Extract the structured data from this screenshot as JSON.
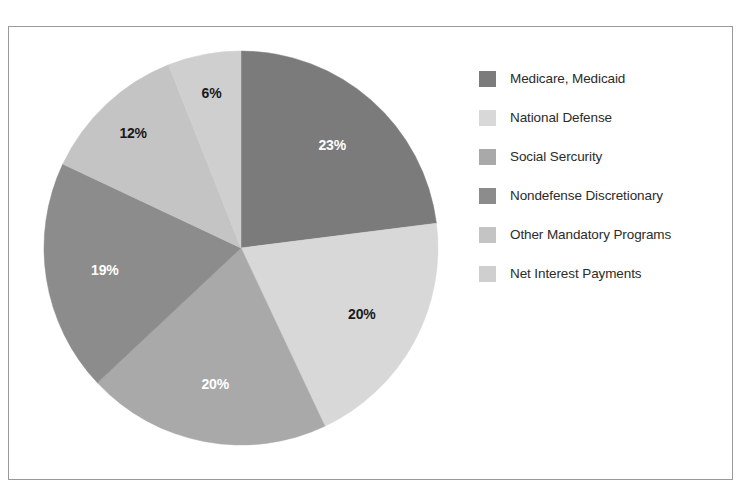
{
  "figure": {
    "clipped_caption": "",
    "frame_color": "#9a9a9a",
    "background": "#ffffff"
  },
  "chart_data": {
    "type": "pie",
    "title": "",
    "xlabel": "",
    "ylabel": "",
    "legend_position": "right",
    "grid": false,
    "start_angle_deg": 0,
    "direction": "clockwise",
    "categories": [
      "Medicare, Medicaid",
      "National Defense",
      "Social Sercurity",
      "Nondefense Discretionary",
      "Other Mandatory Programs",
      "Net Interest Payments"
    ],
    "values": [
      23,
      20,
      20,
      19,
      12,
      6
    ],
    "value_labels": [
      "23%",
      "20%",
      "20%",
      "19%",
      "12%",
      "6%"
    ],
    "colors": [
      "#7b7b7b",
      "#d8d8d8",
      "#a9a9a9",
      "#8c8c8c",
      "#c4c4c4",
      "#cfcfcf"
    ],
    "label_text_colors": [
      "#ffffff",
      "#1a1a1a",
      "#ffffff",
      "#ffffff",
      "#1a1a1a",
      "#1a1a1a"
    ]
  },
  "legend": {
    "items": [
      {
        "label": "Medicare, Medicaid",
        "color": "#7b7b7b"
      },
      {
        "label": "National Defense",
        "color": "#d8d8d8"
      },
      {
        "label": "Social Sercurity",
        "color": "#a9a9a9"
      },
      {
        "label": "Nondefense Discretionary",
        "color": "#8c8c8c"
      },
      {
        "label": "Other Mandatory Programs",
        "color": "#c4c4c4"
      },
      {
        "label": "Net Interest Payments",
        "color": "#cfcfcf"
      }
    ]
  }
}
